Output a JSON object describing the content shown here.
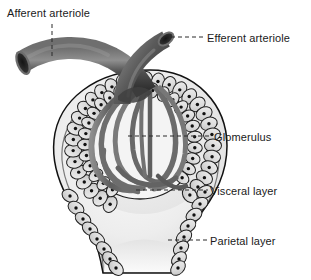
{
  "diagram": {
    "labels": [
      {
        "id": "afferent",
        "text": "Afferent arteriole"
      },
      {
        "id": "efferent",
        "text": "Efferent arteriole"
      },
      {
        "id": "glomerulus",
        "text": "Glomerulus"
      },
      {
        "id": "visceral",
        "text": "Visceral layer"
      },
      {
        "id": "parietal",
        "text": "Parietal layer"
      }
    ],
    "colors": {
      "background": "#ffffff",
      "text": "#1a1a1a",
      "leader_line": "#2b2b2b",
      "vessel_dark": "#4a4a4a",
      "vessel_darker": "#2e2e2e",
      "vessel_light": "#8d8d8d",
      "capillary": "#6b6b6b",
      "capsule_fill": "#e6e6e6",
      "capsule_space": "#f1f1f1",
      "cell_fill": "#dcdcdc",
      "cell_outline": "#1f1f1f",
      "nucleus": "#111111",
      "outline": "#111111"
    }
  }
}
